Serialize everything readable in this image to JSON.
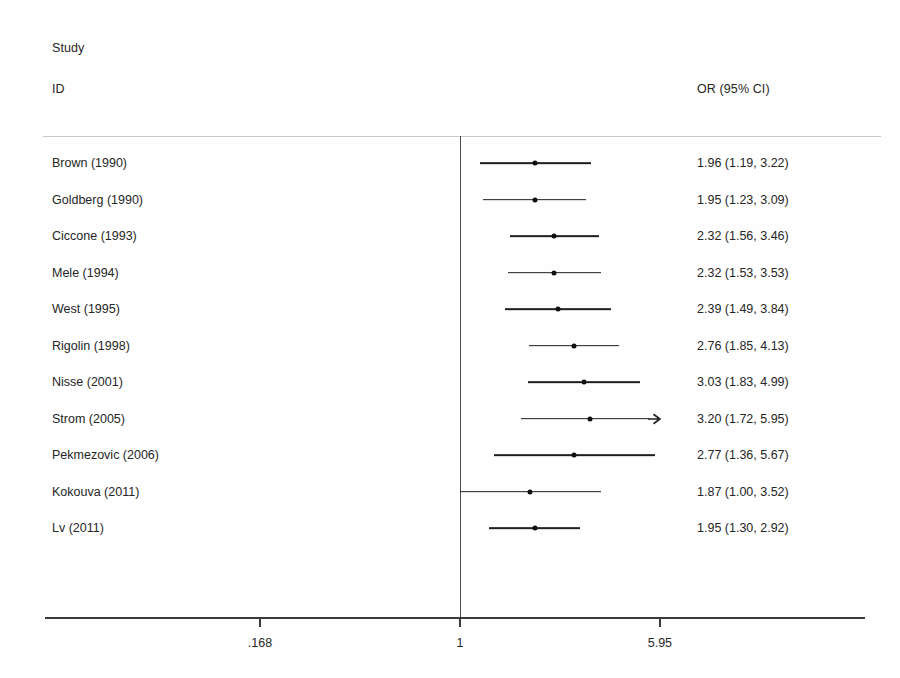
{
  "header": {
    "study_line1": "Study",
    "study_line2": "ID",
    "or_column": "OR (95% CI)"
  },
  "axis": {
    "tick_labels": [
      ".168",
      "1",
      "5.95"
    ],
    "tick_values": [
      0.168,
      1,
      5.95
    ],
    "null_value": 1
  },
  "colors": {
    "line": "#1f1f1f",
    "marker": "#101010",
    "axis": "#3a3a3a",
    "separator": "#c9c9c9",
    "text": "#262626",
    "background": "#fefefe"
  },
  "chart_data": {
    "type": "forest",
    "title": "",
    "xlabel": "",
    "ylabel": "",
    "effect_measure": "OR (95% CI)",
    "scale": "log",
    "xlim": [
      0.168,
      5.95
    ],
    "null_line": 1,
    "grid": false,
    "legend": "none",
    "columns": [
      "Study ID",
      "OR (95% CI)"
    ],
    "rows": [
      {
        "study": "Brown (1990)",
        "or": 1.96,
        "ci_low": 1.19,
        "ci_high": 3.22,
        "label": "1.96 (1.19, 3.22)",
        "truncated_right": false
      },
      {
        "study": "Goldberg (1990)",
        "or": 1.95,
        "ci_low": 1.23,
        "ci_high": 3.09,
        "label": "1.95 (1.23, 3.09)",
        "truncated_right": false
      },
      {
        "study": "Ciccone (1993)",
        "or": 2.32,
        "ci_low": 1.56,
        "ci_high": 3.46,
        "label": "2.32 (1.56, 3.46)",
        "truncated_right": false
      },
      {
        "study": "Mele (1994)",
        "or": 2.32,
        "ci_low": 1.53,
        "ci_high": 3.53,
        "label": "2.32 (1.53, 3.53)",
        "truncated_right": false
      },
      {
        "study": "West (1995)",
        "or": 2.39,
        "ci_low": 1.49,
        "ci_high": 3.84,
        "label": "2.39 (1.49, 3.84)",
        "truncated_right": false
      },
      {
        "study": "Rigolin (1998)",
        "or": 2.76,
        "ci_low": 1.85,
        "ci_high": 4.13,
        "label": "2.76 (1.85, 4.13)",
        "truncated_right": false
      },
      {
        "study": "Nisse (2001)",
        "or": 3.03,
        "ci_low": 1.83,
        "ci_high": 4.99,
        "label": "3.03 (1.83, 4.99)",
        "truncated_right": false
      },
      {
        "study": "Strom (2005)",
        "or": 3.2,
        "ci_low": 1.72,
        "ci_high": 5.95,
        "label": "3.20 (1.72, 5.95)",
        "truncated_right": true
      },
      {
        "study": "Pekmezovic (2006)",
        "or": 2.77,
        "ci_low": 1.36,
        "ci_high": 5.67,
        "label": "2.77 (1.36, 5.67)",
        "truncated_right": false
      },
      {
        "study": "Kokouva (2011)",
        "or": 1.87,
        "ci_low": 1.0,
        "ci_high": 3.52,
        "label": "1.87 (1.00, 3.52)",
        "truncated_right": false
      },
      {
        "study": "Lv (2011)",
        "or": 1.95,
        "ci_low": 1.3,
        "ci_high": 2.92,
        "label": "1.95 (1.30, 2.92)",
        "truncated_right": false
      }
    ]
  }
}
